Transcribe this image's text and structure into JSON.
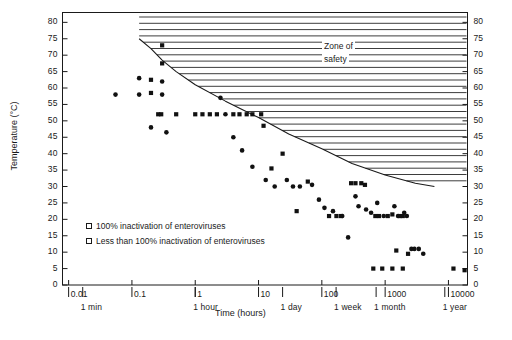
{
  "chart_data": {
    "type": "scatter",
    "title": "",
    "xlabel": "Time (hours)",
    "ylabel": "Temperature (°C)",
    "xscale": "log",
    "xlim": [
      0.008,
      20000
    ],
    "ylim": [
      0,
      83
    ],
    "grid": false,
    "legend_position": "inside-lower-left",
    "x_ticks": [
      "0.01",
      "0.1",
      "1",
      "10",
      "100",
      "1000",
      "10000"
    ],
    "x_tick_values": [
      0.01,
      0.1,
      1,
      10,
      100,
      1000,
      10000
    ],
    "x_secondary_ticks": [
      "1 min",
      "1 hour",
      "1 day",
      "1 week",
      "1 month",
      "1 year"
    ],
    "x_secondary_values": [
      0.0167,
      1,
      24,
      168,
      720,
      8760
    ],
    "y_ticks": [
      "0",
      "5",
      "10",
      "15",
      "20",
      "25",
      "30",
      "35",
      "40",
      "45",
      "50",
      "55",
      "60",
      "65",
      "70",
      "75",
      "80"
    ],
    "y_tick_values": [
      0,
      5,
      10,
      15,
      20,
      25,
      30,
      35,
      40,
      45,
      50,
      55,
      60,
      65,
      70,
      75,
      80
    ],
    "annotations": [
      {
        "text_line1": "Zone of",
        "text_line2": "safety",
        "x": 300,
        "y": 72
      }
    ],
    "safety_boundary": {
      "name": "zone-of-safety-boundary",
      "description": "Descending curve bounding the hatched zone of safety",
      "points": [
        [
          0.13,
          75
        ],
        [
          0.2,
          72
        ],
        [
          0.3,
          68.5
        ],
        [
          0.5,
          65
        ],
        [
          1,
          61
        ],
        [
          3,
          56
        ],
        [
          10,
          51
        ],
        [
          30,
          46
        ],
        [
          100,
          41.5
        ],
        [
          300,
          37
        ],
        [
          1000,
          33.5
        ],
        [
          3000,
          31
        ],
        [
          6000,
          30
        ]
      ]
    },
    "series": [
      {
        "name": "100% inactivation of enteroviruses",
        "marker": "square",
        "legend_label": "100% inactivation of enteroviruses",
        "points": [
          [
            0.2,
            62.5
          ],
          [
            0.2,
            58.5
          ],
          [
            0.26,
            52
          ],
          [
            0.29,
            52
          ],
          [
            0.3,
            73
          ],
          [
            0.3,
            67.5
          ],
          [
            0.5,
            52
          ],
          [
            1.0,
            52
          ],
          [
            1.3,
            52
          ],
          [
            1.7,
            52
          ],
          [
            2.2,
            52
          ],
          [
            4,
            52
          ],
          [
            5,
            52
          ],
          [
            6.5,
            52
          ],
          [
            8,
            52
          ],
          [
            11,
            52
          ],
          [
            12,
            48.5
          ],
          [
            16,
            35.5
          ],
          [
            24,
            40
          ],
          [
            40,
            22.5
          ],
          [
            60,
            31.5
          ],
          [
            130,
            21
          ],
          [
            170,
            21
          ],
          [
            200,
            21
          ],
          [
            290,
            31
          ],
          [
            340,
            31
          ],
          [
            420,
            31
          ],
          [
            480,
            30.5
          ],
          [
            700,
            21
          ],
          [
            800,
            21
          ],
          [
            1100,
            21
          ],
          [
            1300,
            21.5
          ],
          [
            1700,
            21
          ],
          [
            1900,
            21
          ],
          [
            1500,
            10.5
          ],
          [
            2300,
            9.5
          ],
          [
            650,
            5
          ],
          [
            900,
            5
          ],
          [
            1300,
            5
          ],
          [
            1900,
            5
          ],
          [
            12000,
            5
          ],
          [
            18000,
            4.5
          ]
        ]
      },
      {
        "name": "Less than 100% inactivation of enteroviruses",
        "marker": "circle",
        "legend_label": "Less than 100% inactivation of enteroviruses",
        "points": [
          [
            0.055,
            58
          ],
          [
            0.3,
            62
          ],
          [
            0.3,
            58
          ],
          [
            0.13,
            63
          ],
          [
            0.13,
            58
          ],
          [
            0.2,
            48
          ],
          [
            0.35,
            46.5
          ],
          [
            2.5,
            57
          ],
          [
            3,
            52
          ],
          [
            4,
            45
          ],
          [
            5.5,
            41
          ],
          [
            8,
            36
          ],
          [
            13,
            32
          ],
          [
            18,
            30
          ],
          [
            28,
            32
          ],
          [
            35,
            30
          ],
          [
            45,
            30
          ],
          [
            70,
            30.5
          ],
          [
            90,
            26
          ],
          [
            110,
            23.5
          ],
          [
            150,
            22.5
          ],
          [
            210,
            21
          ],
          [
            260,
            14.5
          ],
          [
            340,
            27
          ],
          [
            380,
            24
          ],
          [
            500,
            23
          ],
          [
            600,
            22
          ],
          [
            750,
            25
          ],
          [
            950,
            21
          ],
          [
            1400,
            24
          ],
          [
            1600,
            21
          ],
          [
            2000,
            22
          ],
          [
            2200,
            21
          ],
          [
            2600,
            11
          ],
          [
            2900,
            11
          ],
          [
            3400,
            11
          ],
          [
            4000,
            9.5
          ]
        ]
      }
    ]
  },
  "legend": {
    "items": [
      {
        "marker": "square-open",
        "label": "100% inactivation of enteroviruses"
      },
      {
        "marker": "square-open",
        "label": "Less than 100% inactivation of enteroviruses"
      }
    ]
  },
  "axes": {
    "y_title": "Temperature (°C)",
    "x_title": "Time (hours)"
  }
}
